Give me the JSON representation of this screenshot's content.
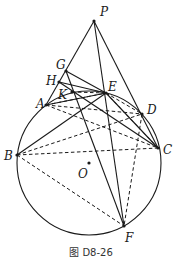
{
  "figure": {
    "caption": "图 D8-26",
    "circle": {
      "name": "circle-O",
      "cx": 89,
      "cy": 163,
      "r": 72
    },
    "points": {
      "P": {
        "label": "P",
        "x": 94,
        "y": 21,
        "lx": 100,
        "ly": 16
      },
      "G": {
        "label": "G",
        "x": 66,
        "y": 71,
        "lx": 56,
        "ly": 69
      },
      "H": {
        "label": "H",
        "x": 59,
        "y": 82,
        "lx": 46,
        "ly": 85
      },
      "K": {
        "label": "K",
        "x": 72,
        "y": 92,
        "lx": 58,
        "ly": 99
      },
      "A": {
        "label": "A",
        "x": 46,
        "y": 105,
        "lx": 36,
        "ly": 108
      },
      "E": {
        "label": "E",
        "x": 106,
        "y": 93,
        "lx": 108,
        "ly": 91
      },
      "D": {
        "label": "D",
        "x": 142,
        "y": 114,
        "lx": 147,
        "ly": 114
      },
      "C": {
        "label": "C",
        "x": 158,
        "y": 148,
        "lx": 163,
        "ly": 154
      },
      "B": {
        "label": "B",
        "x": 17,
        "y": 155,
        "lx": 4,
        "ly": 160
      },
      "O": {
        "label": "O",
        "x": 89,
        "y": 163,
        "lx": 78,
        "ly": 178
      },
      "F": {
        "label": "F",
        "x": 124,
        "y": 226,
        "lx": 125,
        "ly": 242
      }
    },
    "solid_segments": [
      [
        "P",
        "A"
      ],
      [
        "P",
        "C"
      ],
      [
        "P",
        "F"
      ],
      [
        "G",
        "E"
      ],
      [
        "G",
        "F"
      ],
      [
        "H",
        "E"
      ],
      [
        "H",
        "C"
      ],
      [
        "A",
        "E"
      ],
      [
        "B",
        "E"
      ],
      [
        "E",
        "C"
      ]
    ],
    "dashed_segments": [
      [
        "A",
        "E"
      ],
      [
        "A",
        "D"
      ],
      [
        "A",
        "C"
      ],
      [
        "K",
        "E"
      ],
      [
        "B",
        "D"
      ],
      [
        "B",
        "C"
      ],
      [
        "B",
        "F"
      ],
      [
        "E",
        "D"
      ],
      [
        "D",
        "F"
      ],
      [
        "E",
        "C"
      ]
    ]
  }
}
